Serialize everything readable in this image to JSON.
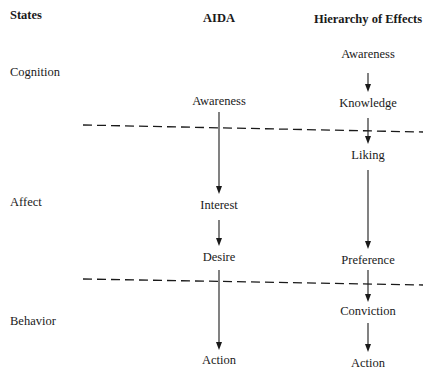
{
  "headers": {
    "states": "States",
    "aida": "AIDA",
    "hierarchy": "Hierarchy of Effects"
  },
  "states": [
    "Cognition",
    "Affect",
    "Behavior"
  ],
  "aida": {
    "steps": [
      "Awareness",
      "Interest",
      "Desire",
      "Action"
    ]
  },
  "hierarchy": {
    "steps": [
      "Awareness",
      "Knowledge",
      "Liking",
      "Preference",
      "Conviction",
      "Action"
    ]
  },
  "dividers": [
    {
      "name": "cognition-affect-boundary"
    },
    {
      "name": "affect-behavior-boundary"
    }
  ],
  "colors": {
    "ink": "#1a1a1a",
    "background": "#ffffff"
  }
}
